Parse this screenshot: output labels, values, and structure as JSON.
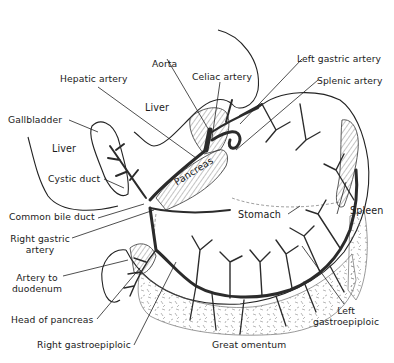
{
  "figure": {
    "type": "anatomical illustration"
  },
  "labels": {
    "aorta": "Aorta",
    "celiac_artery": "Celiac artery",
    "left_gastric_artery": "Left gastric artery",
    "splenic_artery": "Splenic artery",
    "hepatic_artery": "Hepatic artery",
    "liver_upper": "Liver",
    "gallbladder": "Gallbladder",
    "liver_lower": "Liver",
    "cystic_duct": "Cystic duct",
    "pancreas": "Pancreas",
    "stomach": "Stomach",
    "spleen": "Spleen",
    "common_bile_duct": "Common bile duct",
    "right_gastric_artery_line1": "Right gastric",
    "right_gastric_artery_line2": "artery",
    "artery_to_duodenum_line1": "Artery to",
    "artery_to_duodenum_line2": "duodenum",
    "head_of_pancreas": "Head of pancreas",
    "left_gastroepiploic_line1": "Left",
    "left_gastroepiploic_line2": "gastroepiploic",
    "right_gastroepiploic": "Right gastroepiploic",
    "great_omentum": "Great omentum"
  },
  "caption": ""
}
